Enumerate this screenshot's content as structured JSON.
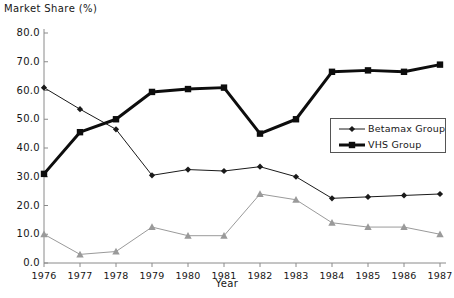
{
  "chart_data": {
    "type": "line",
    "title": "Market Share (%)",
    "xlabel": "Year",
    "ylabel": "",
    "categories": [
      "1976",
      "1977",
      "1978",
      "1979",
      "1980",
      "1981",
      "1982",
      "1983",
      "1984",
      "1985",
      "1986",
      "1987"
    ],
    "x": [
      1976,
      1977,
      1978,
      1979,
      1980,
      1981,
      1982,
      1983,
      1984,
      1985,
      1986,
      1987
    ],
    "ylim": [
      0,
      80
    ],
    "ytick_labels": [
      "0.0",
      "10.0",
      "20.0",
      "30.0",
      "40.0",
      "50.0",
      "60.0",
      "70.0",
      "80.0"
    ],
    "ytick_values": [
      0,
      10,
      20,
      30,
      40,
      50,
      60,
      70,
      80
    ],
    "grid": false,
    "legend_position": "center-right",
    "series": [
      {
        "name": "Betamax Group",
        "marker": "diamond",
        "color": "#1a1a1a",
        "line_width": 1,
        "in_legend": true,
        "values": [
          61.0,
          53.5,
          46.5,
          30.5,
          32.5,
          32.0,
          33.5,
          30.0,
          22.5,
          23.0,
          23.5,
          24.0
        ]
      },
      {
        "name": "VHS Group",
        "marker": "square",
        "color": "#0d0d0d",
        "line_width": 3,
        "in_legend": true,
        "values": [
          31.0,
          45.5,
          50.0,
          59.5,
          60.5,
          61.0,
          45.0,
          50.0,
          66.5,
          67.0,
          66.5,
          69.0
        ]
      },
      {
        "name": "",
        "marker": "triangle",
        "color": "#9a9a9a",
        "line_width": 1,
        "in_legend": false,
        "values": [
          10.0,
          3.0,
          4.0,
          12.5,
          9.5,
          9.5,
          24.0,
          22.0,
          14.0,
          12.5,
          12.5,
          10.0
        ]
      }
    ],
    "legend_entries": [
      {
        "label": "Betamax Group",
        "marker": "diamond",
        "color": "#1a1a1a",
        "line_width": 1
      },
      {
        "label": "VHS Group",
        "marker": "square",
        "color": "#0d0d0d",
        "line_width": 3
      }
    ],
    "axis_color": "#8a8a8a"
  }
}
